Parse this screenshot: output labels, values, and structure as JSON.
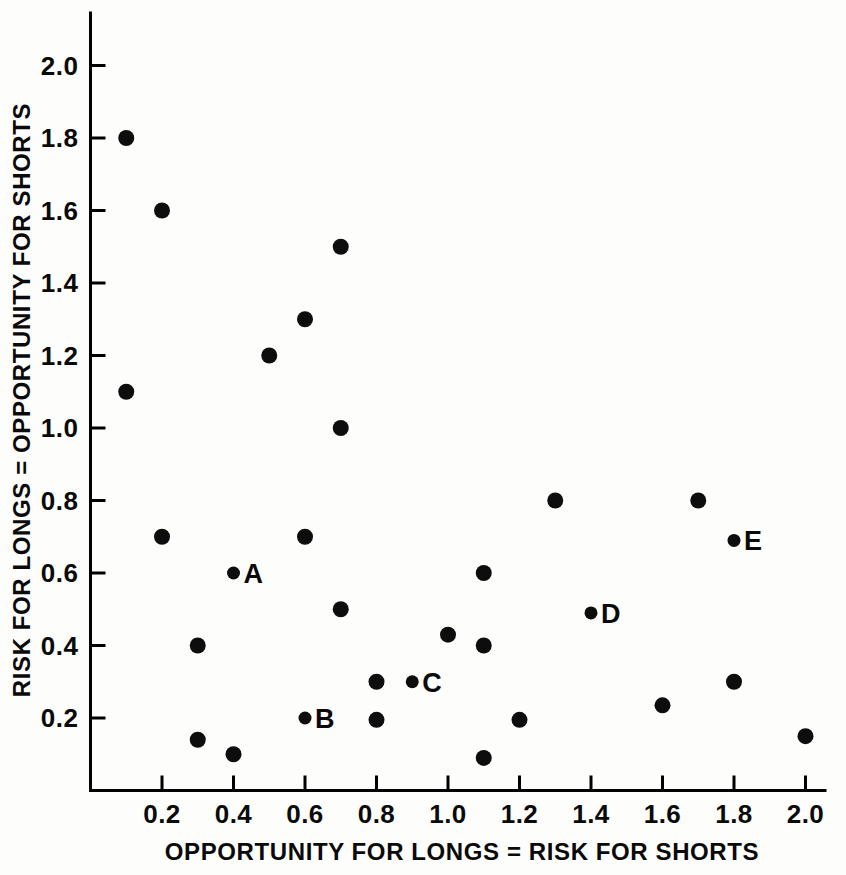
{
  "chart_data": {
    "type": "scatter",
    "title": "",
    "xlabel": "OPPORTUNITY FOR LONGS = RISK FOR SHORTS",
    "ylabel": "RISK FOR LONGS = OPPORTUNITY FOR SHORTS",
    "xlim": [
      0.0,
      2.1
    ],
    "ylim": [
      0.0,
      2.12
    ],
    "grid": false,
    "legend": "none",
    "xticks": [
      0.2,
      0.4,
      0.6,
      0.8,
      1.0,
      1.2,
      1.4,
      1.6,
      1.8,
      2.0
    ],
    "xticklabels": [
      "0.2",
      "0.4",
      "0.6",
      "0.8",
      "1.0",
      "1.2",
      "1.4",
      "1.6",
      "1.8",
      "2.0"
    ],
    "yticks": [
      0.2,
      0.4,
      0.6,
      0.8,
      1.0,
      1.2,
      1.4,
      1.6,
      1.8,
      2.0
    ],
    "yticklabels": [
      "0.2",
      "0.4",
      "0.6",
      "0.8",
      "1.0",
      "1.2",
      "1.4",
      "1.6",
      "1.8",
      "2.0"
    ],
    "marker": "filled-circle",
    "marker_color": "#0d0d0d",
    "points": [
      {
        "x": 0.1,
        "y": 1.8,
        "label": ""
      },
      {
        "x": 0.2,
        "y": 1.6,
        "label": ""
      },
      {
        "x": 0.7,
        "y": 1.5,
        "label": ""
      },
      {
        "x": 0.6,
        "y": 1.3,
        "label": ""
      },
      {
        "x": 0.5,
        "y": 1.2,
        "label": ""
      },
      {
        "x": 0.1,
        "y": 1.1,
        "label": ""
      },
      {
        "x": 0.7,
        "y": 1.0,
        "label": ""
      },
      {
        "x": 1.3,
        "y": 0.8,
        "label": ""
      },
      {
        "x": 1.7,
        "y": 0.8,
        "label": ""
      },
      {
        "x": 0.2,
        "y": 0.7,
        "label": ""
      },
      {
        "x": 0.6,
        "y": 0.7,
        "label": ""
      },
      {
        "x": 1.8,
        "y": 0.69,
        "label": "E"
      },
      {
        "x": 0.4,
        "y": 0.6,
        "label": "A"
      },
      {
        "x": 1.1,
        "y": 0.6,
        "label": ""
      },
      {
        "x": 0.7,
        "y": 0.5,
        "label": ""
      },
      {
        "x": 1.4,
        "y": 0.49,
        "label": "D"
      },
      {
        "x": 1.0,
        "y": 0.43,
        "label": ""
      },
      {
        "x": 0.3,
        "y": 0.4,
        "label": ""
      },
      {
        "x": 1.1,
        "y": 0.4,
        "label": ""
      },
      {
        "x": 0.8,
        "y": 0.3,
        "label": ""
      },
      {
        "x": 0.9,
        "y": 0.3,
        "label": "C"
      },
      {
        "x": 1.8,
        "y": 0.3,
        "label": ""
      },
      {
        "x": 1.6,
        "y": 0.235,
        "label": ""
      },
      {
        "x": 0.6,
        "y": 0.2,
        "label": "B"
      },
      {
        "x": 0.8,
        "y": 0.195,
        "label": ""
      },
      {
        "x": 1.2,
        "y": 0.195,
        "label": ""
      },
      {
        "x": 2.0,
        "y": 0.15,
        "label": ""
      },
      {
        "x": 0.3,
        "y": 0.14,
        "label": ""
      },
      {
        "x": 0.4,
        "y": 0.1,
        "label": ""
      },
      {
        "x": 1.1,
        "y": 0.09,
        "label": ""
      }
    ],
    "annotations": [
      {
        "text": "A",
        "point_x": 0.4,
        "point_y": 0.6
      },
      {
        "text": "B",
        "point_x": 0.6,
        "point_y": 0.2
      },
      {
        "text": "C",
        "point_x": 0.9,
        "point_y": 0.3
      },
      {
        "text": "D",
        "point_x": 1.4,
        "point_y": 0.49
      },
      {
        "text": "E",
        "point_x": 1.8,
        "point_y": 0.69
      }
    ]
  }
}
